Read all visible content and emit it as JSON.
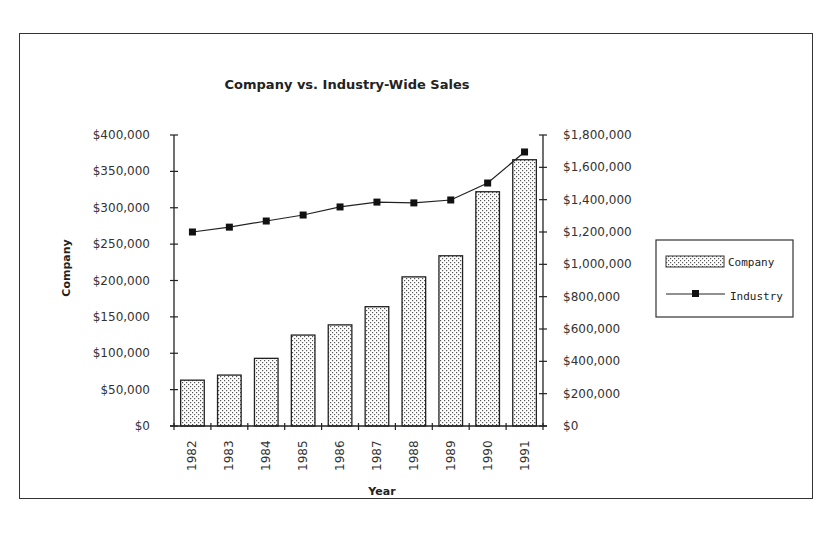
{
  "chart_data": {
    "type": "bar+line",
    "title": "Company vs. Industry-Wide Sales",
    "xlabel": "Year",
    "ylabel": "Company",
    "y2label": "",
    "categories": [
      "1982",
      "1983",
      "1984",
      "1985",
      "1986",
      "1987",
      "1988",
      "1989",
      "1990",
      "1991"
    ],
    "series": [
      {
        "name": "Company",
        "type": "bar",
        "axis": "left",
        "values": [
          63000,
          70000,
          93000,
          125000,
          139000,
          164000,
          205000,
          234000,
          322000,
          366000
        ]
      },
      {
        "name": "Industry",
        "type": "line",
        "axis": "right",
        "marker": "square",
        "values": [
          1200000,
          1230000,
          1268000,
          1305000,
          1355000,
          1385000,
          1380000,
          1398000,
          1503000,
          1695000
        ]
      }
    ],
    "ylim": [
      0,
      400000
    ],
    "y2lim": [
      0,
      1800000
    ],
    "yticks": [
      "$0",
      "$50,000",
      "$100,000",
      "$150,000",
      "$200,000",
      "$250,000",
      "$300,000",
      "$350,000",
      "$400,000"
    ],
    "y2ticks": [
      "$0",
      "$200,000",
      "$400,000",
      "$600,000",
      "$800,000",
      "$1,000,000",
      "$1,200,000",
      "$1,400,000",
      "$1,600,000",
      "$1,800,000"
    ],
    "grid": false,
    "legend": {
      "position": "right",
      "entries": [
        "Company",
        "Industry"
      ]
    }
  }
}
